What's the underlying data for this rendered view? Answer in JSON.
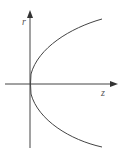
{
  "diagram": {
    "type": "parabola-axes",
    "axes": {
      "vertical": {
        "label": "r",
        "x": 30,
        "y_top": 12,
        "y_bottom": 148
      },
      "horizontal": {
        "label": "z",
        "y": 84,
        "x_left": 5,
        "x_right": 117
      }
    },
    "curve": {
      "description": "parabola opening toward +z with vertex at origin",
      "vertex": [
        30,
        84
      ],
      "upper_end": [
        102,
        19
      ],
      "lower_end": [
        102,
        147
      ]
    },
    "colors": {
      "axis": "#444444",
      "curve": "#444444",
      "label": "#555555",
      "background": "#ffffff"
    }
  }
}
